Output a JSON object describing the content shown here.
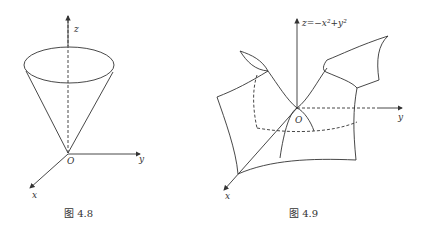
{
  "figures": [
    {
      "id": "fig-4-8",
      "caption": "图  4.8",
      "axes": {
        "z": "z",
        "y": "y",
        "x": "x",
        "origin": "O"
      },
      "shape": "cone"
    },
    {
      "id": "fig-4-9",
      "caption": "图  4.9",
      "equation": "z=−x²+y²",
      "axes": {
        "y": "y",
        "x": "x",
        "origin": "O"
      },
      "shape": "hyperbolic-paraboloid"
    }
  ],
  "colors": {
    "line": "#333333",
    "background": "#ffffff"
  }
}
